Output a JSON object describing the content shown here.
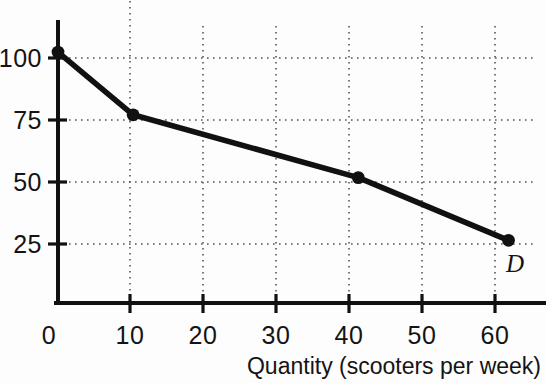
{
  "chart_data": {
    "type": "line",
    "title": "",
    "subtitle": "",
    "xlabel": "Quantity (scooters per week)",
    "ylabel": "",
    "xlim": [
      0,
      65
    ],
    "ylim": [
      0,
      112
    ],
    "grid": true,
    "grid_style": "dotted",
    "legend_position": "inline-right",
    "x": [
      0,
      10,
      40,
      60
    ],
    "series": [
      {
        "name": "D",
        "label": "D",
        "values": [
          100,
          75,
          50,
          25
        ],
        "points": [
          {
            "x": 0,
            "y": 100
          },
          {
            "x": 10,
            "y": 75
          },
          {
            "x": 40,
            "y": 50
          },
          {
            "x": 60,
            "y": 25
          }
        ],
        "color": "#111111",
        "marker": "circle",
        "line_width": 5
      }
    ],
    "xticks": [
      0,
      10,
      20,
      30,
      40,
      50,
      60
    ],
    "xtick_labels": [
      "0",
      "10",
      "20",
      "30",
      "40",
      "50",
      "60"
    ],
    "yticks": [
      25,
      50,
      75,
      100
    ],
    "ytick_labels": [
      "25",
      "50",
      "75",
      "100"
    ],
    "annotations": [
      {
        "text": "D",
        "x": 62,
        "y": 14,
        "style": "italic"
      }
    ]
  },
  "colors": {
    "background": "#fdfdfd",
    "axis": "#111111",
    "grid": "#5a5a5a",
    "curve": "#111111",
    "text": "#141414"
  },
  "axes": {
    "x_axis_name": "quantity-axis",
    "y_axis_name": "price-axis"
  }
}
